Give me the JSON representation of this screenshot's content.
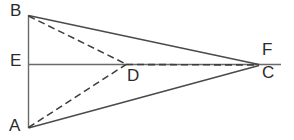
{
  "figure": {
    "type": "geometry-diagram",
    "background_color": "#ffffff",
    "line_color": "#4a4a4a",
    "dashed_line_color": "#3c3c3c",
    "label_color": "#2b2b2b",
    "width": 294,
    "height": 140,
    "labels": {
      "b": "B",
      "e": "E",
      "a": "A",
      "d": "D",
      "f": "F",
      "c": "C"
    },
    "points": {
      "B": {
        "x": 28,
        "y": 15
      },
      "E": {
        "x": 28,
        "y": 64
      },
      "A": {
        "x": 28,
        "y": 128
      },
      "D": {
        "x": 126,
        "y": 64
      },
      "C": {
        "x": 259,
        "y": 64
      },
      "F": {
        "x": 280,
        "y": 64
      }
    },
    "label_positions": {
      "b": {
        "x": 10,
        "y": 2
      },
      "e": {
        "x": 10,
        "y": 52
      },
      "a": {
        "x": 9,
        "y": 117
      },
      "d": {
        "x": 127,
        "y": 67
      },
      "f": {
        "x": 262,
        "y": 41
      },
      "c": {
        "x": 262,
        "y": 64
      }
    },
    "segments": [
      {
        "name": "segment-BA",
        "from": "B",
        "to": "A",
        "style": "solid"
      },
      {
        "name": "segment-BC",
        "from": "B",
        "to": "C",
        "style": "solid"
      },
      {
        "name": "segment-AC",
        "from": "A",
        "to": "C",
        "style": "solid"
      },
      {
        "name": "segment-EF",
        "from": "E",
        "to": "F",
        "style": "solid"
      },
      {
        "name": "segment-BD",
        "from": "B",
        "to": "D",
        "style": "dashed"
      },
      {
        "name": "segment-AD",
        "from": "A",
        "to": "D",
        "style": "dashed"
      },
      {
        "name": "segment-DC",
        "from": "D",
        "to": "C",
        "style": "dashed"
      }
    ]
  }
}
